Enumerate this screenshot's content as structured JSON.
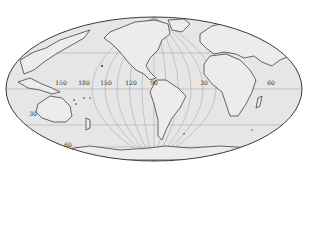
{
  "map": {
    "projection": "equal-area elliptical (Mollweide-style) world map",
    "colors": {
      "background": "#ffffff",
      "ocean": "#e6e6e6",
      "land": "#e9e9e9",
      "coastline": "#2b2b2b",
      "graticule": "#9a9a9a",
      "outline": "#3a3a3a"
    },
    "longitude_labels": [
      {
        "text": "150",
        "x": 61,
        "y": 83
      },
      {
        "text": "180",
        "x": 84,
        "y": 83
      },
      {
        "text": "150",
        "x": 106,
        "y": 83
      },
      {
        "text": "120",
        "x": 131,
        "y": 83
      },
      {
        "text": "90",
        "x": 154,
        "y": 83
      },
      {
        "text": "30",
        "x": 204,
        "y": 83
      },
      {
        "text": "60",
        "x": 271,
        "y": 83
      }
    ],
    "latitude_labels": [
      {
        "text": "30",
        "x": 33,
        "y": 114
      },
      {
        "text": "60",
        "x": 68,
        "y": 145
      }
    ]
  }
}
